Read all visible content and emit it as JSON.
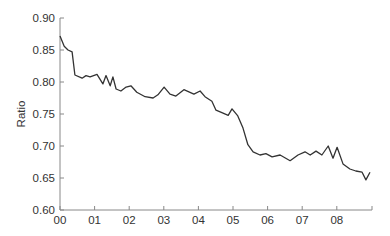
{
  "chart_data": {
    "type": "line",
    "title": "",
    "xlabel": "",
    "ylabel": "Ratio",
    "ylim": [
      0.6,
      0.9
    ],
    "xlim": [
      0,
      9
    ],
    "grid": false,
    "legend": null,
    "y_ticks": [
      "0.60",
      "0.65",
      "0.70",
      "0.75",
      "0.80",
      "0.85",
      "0.90"
    ],
    "y_tick_values": [
      0.6,
      0.65,
      0.7,
      0.75,
      0.8,
      0.85,
      0.9
    ],
    "x_ticks": [
      "00",
      "01",
      "02",
      "03",
      "04",
      "05",
      "06",
      "07",
      "08"
    ],
    "x_tick_values": [
      0,
      1,
      2,
      3,
      4,
      5,
      6,
      7,
      8
    ],
    "series": [
      {
        "name": "Ratio",
        "color": "#333333",
        "x": [
          0.0,
          0.12,
          0.23,
          0.35,
          0.43,
          0.64,
          0.75,
          0.87,
          1.07,
          1.24,
          1.33,
          1.45,
          1.53,
          1.62,
          1.76,
          1.91,
          2.05,
          2.22,
          2.46,
          2.69,
          2.83,
          3.01,
          3.18,
          3.35,
          3.58,
          3.87,
          4.05,
          4.19,
          4.39,
          4.51,
          4.68,
          4.86,
          4.97,
          5.14,
          5.29,
          5.43,
          5.58,
          5.78,
          5.95,
          6.13,
          6.36,
          6.65,
          6.88,
          7.08,
          7.23,
          7.4,
          7.57,
          7.75,
          7.89,
          8.01,
          8.18,
          8.38,
          8.55,
          8.73,
          8.84,
          8.96
        ],
        "values": [
          0.872,
          0.856,
          0.85,
          0.847,
          0.811,
          0.806,
          0.81,
          0.808,
          0.812,
          0.797,
          0.81,
          0.794,
          0.808,
          0.789,
          0.786,
          0.792,
          0.794,
          0.784,
          0.777,
          0.775,
          0.78,
          0.792,
          0.781,
          0.778,
          0.788,
          0.781,
          0.786,
          0.777,
          0.77,
          0.756,
          0.752,
          0.748,
          0.758,
          0.747,
          0.728,
          0.702,
          0.691,
          0.686,
          0.688,
          0.683,
          0.686,
          0.677,
          0.686,
          0.691,
          0.686,
          0.692,
          0.686,
          0.7,
          0.681,
          0.698,
          0.672,
          0.664,
          0.661,
          0.659,
          0.647,
          0.659
        ]
      }
    ]
  }
}
